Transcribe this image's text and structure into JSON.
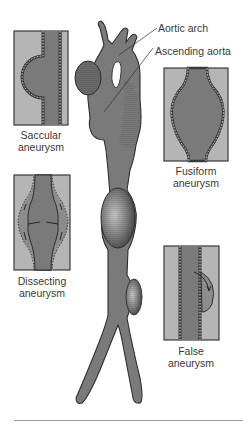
{
  "diagram": {
    "colors": {
      "vessel": "#7a7a7a",
      "vessel_dark": "#5c5c5c",
      "panel_bg": "#b5b5b5",
      "panel_border": "#3a3a3a",
      "wall_dash": "#ffffff",
      "text": "#3a3a3a"
    },
    "callouts": [
      {
        "id": "aortic-arch",
        "label": "Aortic arch"
      },
      {
        "id": "ascending-aorta",
        "label": "Ascending aorta"
      }
    ],
    "panels": [
      {
        "id": "saccular",
        "line1": "Saccular",
        "line2": "aneurysm"
      },
      {
        "id": "fusiform",
        "line1": "Fusiform",
        "line2": "aneurysm"
      },
      {
        "id": "dissecting",
        "line1": "Dissecting",
        "line2": "aneurysm"
      },
      {
        "id": "false",
        "line1": "False",
        "line2": "aneurysm"
      }
    ]
  }
}
